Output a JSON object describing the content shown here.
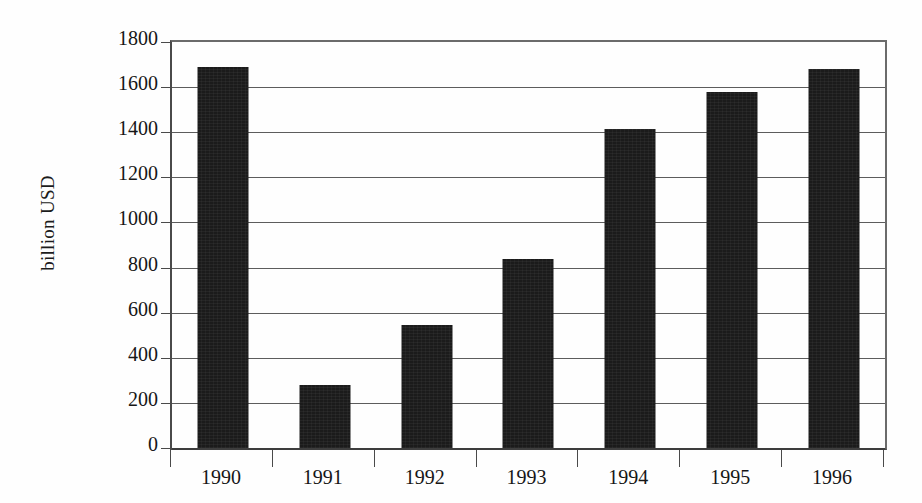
{
  "chart_data": {
    "type": "bar",
    "title": "",
    "xlabel": "",
    "ylabel": "billion USD",
    "categories": [
      "1990",
      "1991",
      "1992",
      "1993",
      "1994",
      "1995",
      "1996"
    ],
    "values": [
      1690,
      280,
      545,
      840,
      1415,
      1580,
      1680
    ],
    "ylim": [
      0,
      1800
    ],
    "yticks": [
      0,
      200,
      400,
      600,
      800,
      1000,
      1200,
      1400,
      1600,
      1800
    ],
    "ytick_labels": [
      "0",
      "200",
      "400",
      "600",
      "800",
      "1000",
      "1200",
      "1400",
      "1600",
      "1800"
    ],
    "grid": true,
    "legend": null,
    "bar_color": "#1b1b1b",
    "background_color": "#fefefe",
    "axis_color": "#4a4a4a"
  }
}
